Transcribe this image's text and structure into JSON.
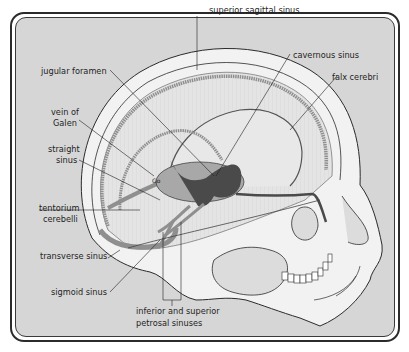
{
  "diagram": {
    "labels": {
      "superior_sagittal_sinus": "superior sagittal sinus",
      "cavernous_sinus": "cavernous sinus",
      "falx_cerebri": "falx cerebri",
      "jugular_foramen": "jugular foramen",
      "vein_of_galen_1": "vein of",
      "vein_of_galen_2": "Galen",
      "straight_sinus_1": "straight",
      "straight_sinus_2": "sinus",
      "tentorium_1": "tentorium",
      "tentorium_2": "cerebelli",
      "transverse_sinus": "transverse sinus",
      "sigmoid_sinus": "sigmoid sinus",
      "petrosal_1": "inferior and superior",
      "petrosal_2": "petrosal sinuses",
      "galen_marker": "Go"
    },
    "colors": {
      "background": "#d6d6d6",
      "skull": "#f1f1f1",
      "sinus_mid": "#8f8f8f",
      "sinus_dark": "#4a4a4a",
      "outline": "#2b2b2b"
    }
  }
}
